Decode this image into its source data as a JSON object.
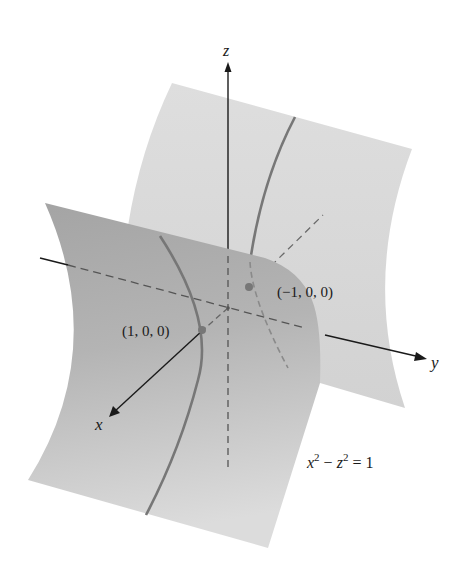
{
  "figure": {
    "equation": {
      "lhs_var1": "x",
      "sup1": "2",
      "minus": " − ",
      "lhs_var2": "z",
      "sup2": "2",
      "rhs": " = 1"
    },
    "axes": {
      "x_label": "x",
      "y_label": "y",
      "z_label": "z"
    },
    "points": [
      {
        "label": "(1, 0, 0)"
      },
      {
        "label": "(−1, 0, 0)"
      }
    ],
    "colors": {
      "back_sheet": "#dcdcdc",
      "front_sheet_top": "#a6a6a6",
      "front_sheet_bottom": "#dadada",
      "curve": "#777777",
      "axis": "#1a1a1a",
      "dash": "#5a5a5a",
      "point": "#777777"
    }
  }
}
